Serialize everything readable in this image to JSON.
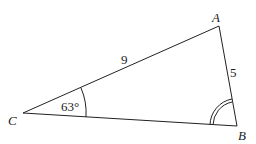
{
  "diagram": {
    "type": "triangle",
    "vertices": {
      "A": {
        "label": "A",
        "x": 219,
        "y": 26
      },
      "B": {
        "label": "B",
        "x": 237,
        "y": 126
      },
      "C": {
        "label": "C",
        "x": 23,
        "y": 113
      }
    },
    "sides": {
      "CA": {
        "label": "9"
      },
      "AB": {
        "label": "5"
      }
    },
    "angles": {
      "C": {
        "label": "63°",
        "marker": "single-arc"
      },
      "B": {
        "label": "",
        "marker": "double-arc"
      }
    },
    "colors": {
      "stroke": "#222222",
      "background": "#ffffff"
    }
  }
}
